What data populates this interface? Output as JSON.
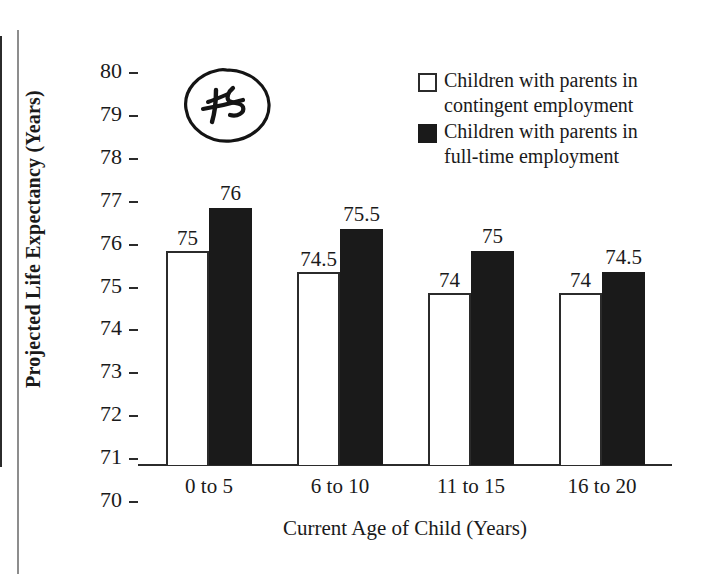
{
  "chart_data": {
    "type": "bar",
    "title": "",
    "xlabel": "Current Age of Child (Years)",
    "ylabel": "Projected Life Expectancy (Years)",
    "categories": [
      "0 to 5",
      "6 to 10",
      "11 to 15",
      "16 to 20"
    ],
    "ylim": [
      70,
      80
    ],
    "ytick_labels": [
      "80",
      "79",
      "78",
      "77",
      "76",
      "75",
      "74",
      "73",
      "72",
      "71",
      "70"
    ],
    "ytick_values": [
      80,
      79,
      78,
      77,
      76,
      75,
      74,
      73,
      72,
      71,
      70
    ],
    "grid": false,
    "legend_position": "top-right",
    "series": [
      {
        "name": "Children with parents in\ncontingent employment",
        "color": "#ffffff",
        "edge_color": "#2b2b2b",
        "values": [
          75,
          74.5,
          74,
          74
        ],
        "value_labels": [
          "75",
          "74.5",
          "74",
          "74"
        ]
      },
      {
        "name": "Children with parents in\nfull-time employment",
        "color": "#1a1a1a",
        "edge_color": "#1a1a1a",
        "values": [
          76,
          75.5,
          75,
          74.5
        ],
        "value_labels": [
          "76",
          "75.5",
          "75",
          "74.5"
        ]
      }
    ],
    "annotations": [
      {
        "type": "handwritten-circled-number",
        "text": "75",
        "struck_through": true,
        "shape": "ellipse"
      }
    ]
  },
  "axis": {
    "y_title": "Projected Life Expectancy (Years)",
    "x_title": "Current Age of Child (Years)"
  },
  "legend": {
    "entries": [
      {
        "swatch": "light",
        "label": "Children with parents in\ncontingent employment"
      },
      {
        "swatch": "dark",
        "label": "Children with parents in\nfull-time employment"
      }
    ]
  },
  "annotation": {
    "value": "75"
  }
}
